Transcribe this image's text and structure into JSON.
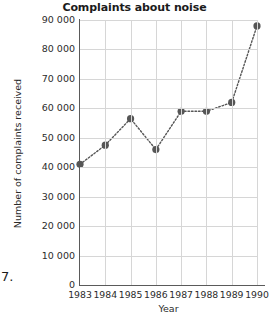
{
  "chart_data": {
    "type": "line",
    "title": "Complaints about noise",
    "xlabel": "Year",
    "ylabel": "Number of complaints received",
    "categories": [
      "1983",
      "1984",
      "1985",
      "1986",
      "1987",
      "1988",
      "1989",
      "1990"
    ],
    "values": [
      41000,
      47500,
      56500,
      46000,
      59000,
      59000,
      62000,
      88000
    ],
    "x": [
      1983,
      1984,
      1985,
      1986,
      1987,
      1988,
      1989,
      1990
    ],
    "xlim": [
      1983,
      1990
    ],
    "ylim": [
      0,
      90000
    ],
    "y_ticks": [
      "0",
      "10 000",
      "20 000",
      "30 000",
      "40 000",
      "50 000",
      "60 000",
      "70 000",
      "80 000",
      "90 000"
    ],
    "y_tick_values": [
      0,
      10000,
      20000,
      30000,
      40000,
      50000,
      60000,
      70000,
      80000,
      90000
    ],
    "x_ticks": [
      "1983",
      "1984",
      "1985",
      "1986",
      "1987",
      "1988",
      "1989",
      "1990"
    ],
    "grid": true,
    "legend": null,
    "line_style": "dotted",
    "marker": "circle",
    "series_color": "#565656",
    "grid_color": "#d6d6d6",
    "axis_color": "#5a5a5a"
  },
  "page": {
    "list_number": "7."
  }
}
